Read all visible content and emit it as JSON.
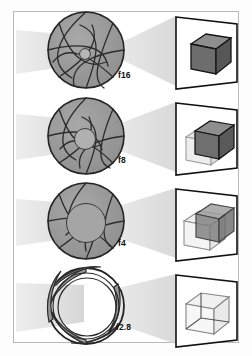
{
  "figure": {
    "border_color": "#b9b9b9",
    "background": "#ffffff",
    "ink_color": "#1a1a1a"
  },
  "colors": {
    "beam_light": "#e9e9e9",
    "beam_mid": "#d8d8d8",
    "blade_fill": "#9b9b9b",
    "blade_fill_dark": "#8d8d8d",
    "blade_stroke": "#2a2a2a",
    "box_sharp_top": "#8a8a8a",
    "box_sharp_front": "#6e6e6e",
    "box_sharp_side": "#5a5a5a",
    "box_ghost": "#d5d5d5",
    "frame_stroke": "#111111"
  },
  "rows": [
    {
      "id": "row-f16",
      "fstop": "f16",
      "aperture_state": "nearly-closed",
      "blade_count": 8,
      "opening_ratio": 0.12,
      "beam_shape": "narrow-cone",
      "beam_entry_half_height": 16,
      "beam_exit_half_height": 8,
      "dof": "deep",
      "blur_offset_px": 0,
      "ghost_boxes": 0,
      "box_opacity": 1.0
    },
    {
      "id": "row-f8",
      "fstop": "f8",
      "aperture_state": "mostly-closed",
      "blade_count": 8,
      "opening_ratio": 0.3,
      "beam_shape": "medium-cone",
      "beam_entry_half_height": 17,
      "beam_exit_half_height": 11,
      "dof": "moderate",
      "blur_offset_px": 7,
      "ghost_boxes": 1,
      "box_opacity": 1.0
    },
    {
      "id": "row-f4",
      "fstop": "f4",
      "aperture_state": "mostly-open",
      "blade_count": 8,
      "opening_ratio": 0.56,
      "beam_shape": "wide-cone",
      "beam_entry_half_height": 18,
      "beam_exit_half_height": 14,
      "dof": "shallow",
      "blur_offset_px": 12,
      "ghost_boxes": 1,
      "box_opacity": 0.75
    },
    {
      "id": "row-f2.8",
      "fstop": "f2.8",
      "aperture_state": "wide-open",
      "blade_count": 8,
      "opening_ratio": 0.82,
      "beam_shape": "widest-band",
      "beam_entry_half_height": 19,
      "beam_exit_half_height": 18,
      "dof": "very-shallow",
      "blur_offset_px": 16,
      "ghost_boxes": 1,
      "box_opacity": 0.45
    }
  ]
}
